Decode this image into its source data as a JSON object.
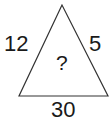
{
  "puzzle": {
    "left_side": "12",
    "right_side": "5",
    "base": "30",
    "center": "?"
  },
  "colors": {
    "stroke": "#333333",
    "text": "#1a1a1a"
  }
}
